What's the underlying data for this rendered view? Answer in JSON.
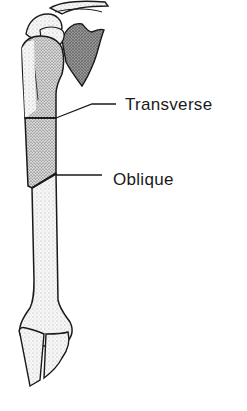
{
  "diagram": {
    "labels": [
      {
        "id": "transverse",
        "text": "Transverse"
      },
      {
        "id": "oblique",
        "text": "Oblique"
      }
    ],
    "colors": {
      "line": "#1a1a1a",
      "bone_fill": "#f4f4f4",
      "stipple": "#555555",
      "background": "#ffffff"
    }
  }
}
